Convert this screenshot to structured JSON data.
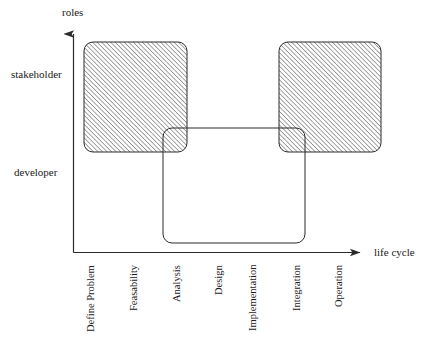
{
  "diagram": {
    "title_axis_y": "roles",
    "title_axis_x": "life cycle",
    "axes": {
      "y_axis_label": "roles",
      "x_axis_label": "life cycle",
      "y_categories": [
        "developer",
        "stakeholder"
      ],
      "x_categories": [
        "Define Problem",
        "Feasability",
        "Analysis",
        "Design",
        "Implementation",
        "Integration",
        "Operation"
      ]
    },
    "role_labels": [
      {
        "name": "stakeholder",
        "text": "stakeholder"
      },
      {
        "name": "developer",
        "text": "developer"
      }
    ],
    "stage_labels": [
      {
        "text": "Define Problem",
        "x": 90
      },
      {
        "text": "Feasability",
        "x": 133
      },
      {
        "text": "Analysis",
        "x": 176
      },
      {
        "text": "Design",
        "x": 218
      },
      {
        "text": "Implementation",
        "x": 252
      },
      {
        "text": "Integration",
        "x": 296
      },
      {
        "text": "Operation",
        "x": 338
      }
    ],
    "regions": [
      {
        "name": "stakeholder-early-region",
        "role": "stakeholder",
        "fill": "hatched",
        "stages": [
          "Define Problem",
          "Feasability",
          "Analysis"
        ],
        "x": 84,
        "y": 42,
        "width": 103,
        "height": 110
      },
      {
        "name": "stakeholder-late-region",
        "role": "stakeholder",
        "fill": "hatched",
        "stages": [
          "Integration",
          "Operation"
        ],
        "x": 279,
        "y": 42,
        "width": 102,
        "height": 110
      },
      {
        "name": "developer-region",
        "role": "developer",
        "fill": "none",
        "stages": [
          "Analysis",
          "Design",
          "Implementation",
          "Integration"
        ],
        "x": 163,
        "y": 128,
        "width": 142,
        "height": 115
      }
    ],
    "colors": {
      "stroke": "#2b2b2b",
      "hatch": "#555555",
      "background": "#ffffff"
    }
  }
}
